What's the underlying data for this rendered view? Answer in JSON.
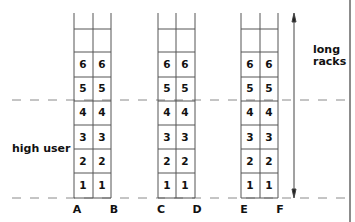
{
  "diagram": {
    "labels": {
      "high_user": "high user",
      "long_racks_line1": "long",
      "long_racks_line2": "racks"
    },
    "columns": [
      "A",
      "B",
      "C",
      "D",
      "E",
      "F"
    ],
    "racks": [
      {
        "name": "A-B",
        "columns": [
          "A",
          "B"
        ],
        "levels": [
          "6",
          "5",
          "4",
          "3",
          "2",
          "1"
        ]
      },
      {
        "name": "C-D",
        "columns": [
          "C",
          "D"
        ],
        "levels": [
          "6",
          "5",
          "4",
          "3",
          "2",
          "1"
        ]
      },
      {
        "name": "E-F",
        "columns": [
          "E",
          "F"
        ],
        "levels": [
          "6",
          "5",
          "4",
          "3",
          "2",
          "1"
        ]
      }
    ],
    "colors": {
      "line": "#555555",
      "dash": "#888888",
      "text": "#111111"
    }
  }
}
